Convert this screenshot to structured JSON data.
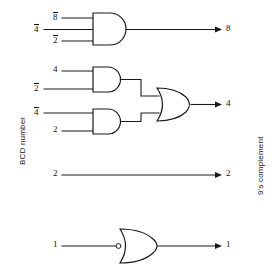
{
  "diagram": {
    "side_labels": {
      "left": "BCD number",
      "right": "9's complement"
    },
    "colors": {
      "line": "#1a1a1a",
      "background": "#ffffff",
      "text": "#111111"
    },
    "rows": [
      {
        "id": "row-8",
        "gate": "AND",
        "inputs": [
          {
            "label": "8",
            "overbar": true
          },
          {
            "label": "4",
            "overbar": true
          },
          {
            "label": "2",
            "overbar": true
          }
        ],
        "output": {
          "label": "8",
          "overbar": false
        }
      },
      {
        "id": "row-4",
        "gate": "OR",
        "sub_gates": [
          {
            "id": "and-upper",
            "gate": "AND",
            "inputs": [
              {
                "label": "4",
                "overbar": false
              },
              {
                "label": "2",
                "overbar": true
              }
            ]
          },
          {
            "id": "and-lower",
            "gate": "AND",
            "inputs": [
              {
                "label": "4",
                "overbar": true
              },
              {
                "label": "2",
                "overbar": false
              }
            ]
          }
        ],
        "output": {
          "label": "4",
          "overbar": false
        }
      },
      {
        "id": "row-2",
        "gate": "NONE",
        "inputs": [
          {
            "label": "2",
            "overbar": false
          }
        ],
        "output": {
          "label": "2",
          "overbar": false
        }
      },
      {
        "id": "row-1",
        "gate": "OR",
        "inputs": [
          {
            "label": "1",
            "overbar": false
          }
        ],
        "output": {
          "label": "1",
          "overbar": false
        }
      }
    ]
  }
}
